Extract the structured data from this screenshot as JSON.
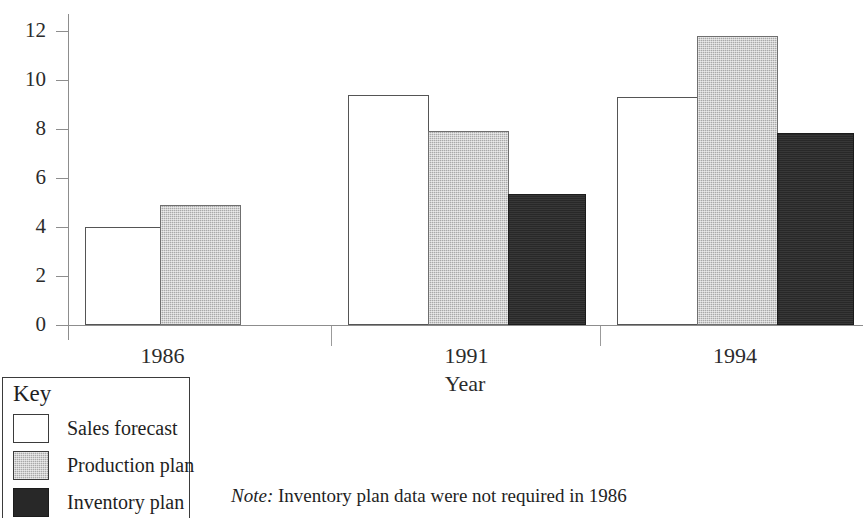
{
  "chart_data": {
    "type": "bar",
    "title": "",
    "subtitle": "",
    "xlabel": "Year",
    "ylabel": "",
    "categories": [
      "1986",
      "1991",
      "1994"
    ],
    "series": [
      {
        "name": "Sales forecast",
        "key": "white",
        "values": [
          4.0,
          9.4,
          9.3
        ]
      },
      {
        "name": "Production plan",
        "key": "gray",
        "values": [
          4.9,
          7.9,
          11.8
        ]
      },
      {
        "name": "Inventory plan",
        "key": "black",
        "values": [
          null,
          5.35,
          7.85
        ]
      }
    ],
    "ylim": [
      0,
      12
    ],
    "yticks": [
      0,
      2,
      4,
      6,
      8,
      10,
      12
    ],
    "ytick_labels": [
      "0",
      "2",
      "4",
      "6",
      "8",
      "10",
      "12"
    ],
    "grid": false,
    "legend_position": "below-left",
    "legend_title": "Key",
    "bar_style": {
      "white": "#ffffff",
      "gray": "#a9a9a9",
      "black": "#282828",
      "outline": "#3b3b3b"
    }
  },
  "axis": {
    "x_title": "Year",
    "tick_labels": [
      "0",
      "2",
      "4",
      "6",
      "8",
      "10",
      "12"
    ],
    "group_labels": [
      "1986",
      "1991",
      "1994"
    ]
  },
  "legend": {
    "title": "Key",
    "items": [
      {
        "label": "Sales forecast",
        "swatch": "white"
      },
      {
        "label": "Production plan",
        "swatch": "gray"
      },
      {
        "label": "Inventory plan",
        "swatch": "black"
      }
    ]
  },
  "note": {
    "keyword": "Note:",
    "text": " Inventory plan data were not required in 1986"
  }
}
